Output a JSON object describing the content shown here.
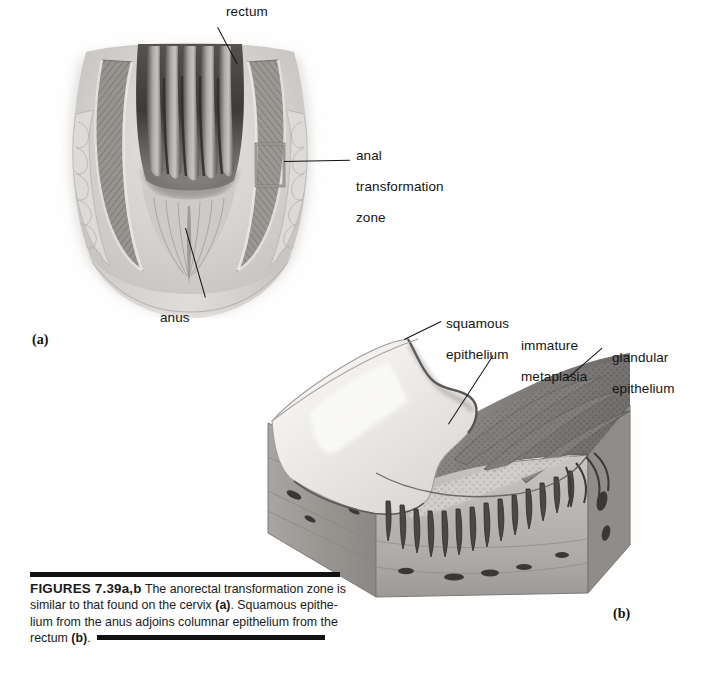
{
  "figure": {
    "id": "FIGURES 7.39a,b",
    "caption_text": "The anorectal transformation zone is similar to that found on the cervix (a). Squamous epithelium from the anus adjoins columnar epithelium from the rectum (b).",
    "caption_lead": "FIGURES 7.39a,b",
    "caption_line1": "The anorectal transformation zone",
    "caption_line2a": "is similar to that found on the cervix ",
    "caption_line2b": "(a)",
    "caption_line2c": ". Squamous epithe-",
    "caption_line3": "lium from the anus adjoins columnar epithelium from the",
    "caption_line4a": "rectum ",
    "caption_line4b": "(b)",
    "caption_line4c": "."
  },
  "panel_a": {
    "mark": "(a)",
    "title": "anorectal coronal section",
    "labels": {
      "rectum": "rectum",
      "anus": "anus",
      "anal_transformation_zone": "anal\ntransformation\nzone",
      "anal_transformation_zone_line1": "anal",
      "anal_transformation_zone_line2": "transformation",
      "anal_transformation_zone_line3": "zone"
    }
  },
  "panel_b": {
    "mark": "(b)",
    "title": "transformation zone block diagram",
    "labels": {
      "squamous_epithelium_line1": "squamous",
      "squamous_epithelium_line2": "epithelium",
      "immature_metaplasia_line1": "immature",
      "immature_metaplasia_line2": "metaplasia",
      "glandular_epithelium_line1": "glandular",
      "glandular_epithelium_line2": "epithelium"
    }
  },
  "colors": {
    "page_background": "#fefefe",
    "rule": "#121212",
    "text": "#141414",
    "tissue_light": "#e3e0dd",
    "tissue_mid": "#b9b5b2",
    "tissue_dark": "#6e6b69",
    "lumen_dark": "#3b3937",
    "muscle_hatch": "#8e8a87",
    "squamous_pale": "#efeeec",
    "glandular_dark": "#707070"
  }
}
